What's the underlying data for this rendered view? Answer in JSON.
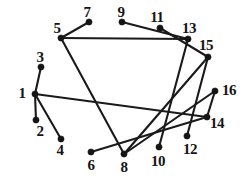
{
  "figure": {
    "type": "node-link-graph",
    "background_color": "#ffffff",
    "ink_color": "#141414",
    "width": 250,
    "height": 186
  },
  "graph_data": {
    "type": "graph",
    "node_count": 16,
    "edge_count": 15,
    "nodes": [
      {
        "id": "1",
        "label": "1",
        "x": 35,
        "y": 94,
        "label_x": 22,
        "label_y": 93
      },
      {
        "id": "2",
        "label": "2",
        "x": 36,
        "y": 120,
        "label_x": 40,
        "label_y": 131
      },
      {
        "id": "3",
        "label": "3",
        "x": 41,
        "y": 67,
        "label_x": 40,
        "label_y": 57
      },
      {
        "id": "4",
        "label": "4",
        "x": 61,
        "y": 139,
        "label_x": 60,
        "label_y": 150
      },
      {
        "id": "5",
        "label": "5",
        "x": 61,
        "y": 38,
        "label_x": 57,
        "label_y": 28
      },
      {
        "id": "6",
        "label": "6",
        "x": 91,
        "y": 152,
        "label_x": 91,
        "label_y": 165
      },
      {
        "id": "7",
        "label": "7",
        "x": 89,
        "y": 22,
        "label_x": 87,
        "label_y": 12
      },
      {
        "id": "8",
        "label": "8",
        "x": 124,
        "y": 154,
        "label_x": 124,
        "label_y": 167
      },
      {
        "id": "9",
        "label": "9",
        "x": 122,
        "y": 22,
        "label_x": 121,
        "label_y": 12
      },
      {
        "id": "10",
        "label": "10",
        "x": 159,
        "y": 147,
        "label_x": 158,
        "label_y": 161
      },
      {
        "id": "11",
        "label": "11",
        "x": 160,
        "y": 28,
        "label_x": 157,
        "label_y": 17
      },
      {
        "id": "12",
        "label": "12",
        "x": 187,
        "y": 136,
        "label_x": 190,
        "label_y": 149
      },
      {
        "id": "13",
        "label": "13",
        "x": 188,
        "y": 39,
        "label_x": 189,
        "label_y": 28
      },
      {
        "id": "14",
        "label": "14",
        "x": 207,
        "y": 117,
        "label_x": 217,
        "label_y": 123
      },
      {
        "id": "15",
        "label": "15",
        "x": 208,
        "y": 57,
        "label_x": 206,
        "label_y": 45
      },
      {
        "id": "16",
        "label": "16",
        "x": 215,
        "y": 91,
        "label_x": 229,
        "label_y": 90
      }
    ],
    "edges": [
      {
        "source": "1",
        "target": "3"
      },
      {
        "source": "1",
        "target": "2"
      },
      {
        "source": "1",
        "target": "4"
      },
      {
        "source": "1",
        "target": "14"
      },
      {
        "source": "5",
        "target": "7"
      },
      {
        "source": "5",
        "target": "13"
      },
      {
        "source": "5",
        "target": "8"
      },
      {
        "source": "9",
        "target": "13"
      },
      {
        "source": "11",
        "target": "15"
      },
      {
        "source": "13",
        "target": "10"
      },
      {
        "source": "15",
        "target": "12"
      },
      {
        "source": "15",
        "target": "8"
      },
      {
        "source": "6",
        "target": "14"
      },
      {
        "source": "8",
        "target": "16"
      },
      {
        "source": "14",
        "target": "16"
      }
    ]
  }
}
